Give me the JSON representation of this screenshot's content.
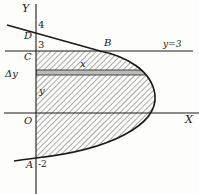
{
  "diagram": {
    "type": "area-between-curves",
    "axes": {
      "x_label": "X",
      "y_label": "Y",
      "origin_label": "O"
    },
    "points": [
      {
        "name": "D",
        "label": "D"
      },
      {
        "name": "C",
        "label": "C"
      },
      {
        "name": "B",
        "label": "B"
      },
      {
        "name": "A",
        "label": "A"
      }
    ],
    "tick_labels": {
      "four": "4",
      "three": "3",
      "minus_two": "-2"
    },
    "line_label": "y=3",
    "strip": {
      "delta_label": "Δy",
      "length_label": "x",
      "height_label": "y"
    },
    "colors": {
      "ink": "#1a1a1a",
      "hatch": "#444444",
      "background": "#fdfdfc"
    }
  }
}
